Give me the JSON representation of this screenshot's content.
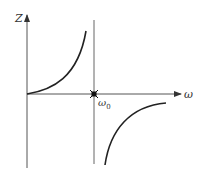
{
  "diagram": {
    "type": "reactance-frequency-plot",
    "y_axis_label": "Z",
    "x_axis_label": "ω",
    "resonance_label_base": "ω",
    "resonance_label_sub": "0",
    "colors": {
      "axis": "#555555",
      "curve": "#222222",
      "marker": "#111111",
      "text": "#333333"
    }
  }
}
